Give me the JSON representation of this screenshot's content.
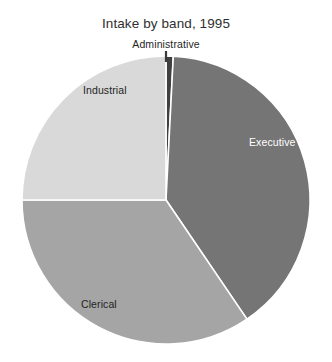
{
  "chart_data": {
    "type": "pie",
    "title": "Intake by band, 1995",
    "xlabel": "",
    "ylabel": "",
    "legend_position": "none",
    "labels_on_slices": true,
    "categories": [
      "Administrative",
      "Executive",
      "Clerical",
      "Industrial"
    ],
    "values": [
      0.8,
      39.7,
      34.5,
      25.0
    ],
    "units": "percent",
    "start_angle_deg": 0,
    "direction": "clockwise",
    "slices": [
      {
        "name": "Administrative",
        "value": 0.8,
        "color": "#404040",
        "label_color": "#1f1f1f",
        "label_placement": "outside-top",
        "has_leader_line": true,
        "start_angle_deg": 0,
        "end_angle_deg": 2.9
      },
      {
        "name": "Executive",
        "value": 39.7,
        "color": "#757575",
        "label_color": "#ffffff",
        "label_placement": "inside",
        "has_leader_line": false,
        "start_angle_deg": 2.9,
        "end_angle_deg": 145.8
      },
      {
        "name": "Clerical",
        "value": 34.5,
        "color": "#a5a5a5",
        "label_color": "#1f1f1f",
        "label_placement": "inside",
        "has_leader_line": false,
        "start_angle_deg": 145.8,
        "end_angle_deg": 270.0
      },
      {
        "name": "Industrial",
        "value": 25.0,
        "color": "#d9d9d9",
        "label_color": "#1f1f1f",
        "label_placement": "inside",
        "has_leader_line": false,
        "start_angle_deg": 270.0,
        "end_angle_deg": 360.0
      }
    ],
    "geometry": {
      "center_x": 166,
      "center_y": 200,
      "radius": 144,
      "separator_color": "#ffffff",
      "separator_width": 1.6
    },
    "background_color": "#ffffff"
  },
  "labels": {
    "administrative": "Administrative",
    "executive": "Executive",
    "clerical": "Clerical",
    "industrial": "Industrial"
  }
}
